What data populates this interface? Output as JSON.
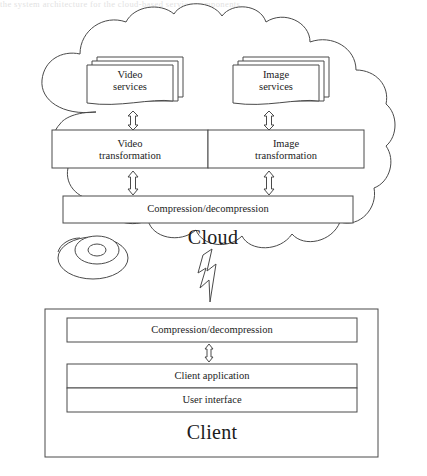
{
  "page": {
    "width": 427,
    "height": 476,
    "background": "#ffffff",
    "stroke_color": "#4a4a4a",
    "text_color": "#1c1c1c",
    "top_partial_text": "the system architecture for the cloud-based service components"
  },
  "diagram": {
    "title_cloud": "Cloud",
    "title_client": "Client",
    "cloud": {
      "label": "Cloud",
      "service_stacks": [
        {
          "name": "video-services",
          "line1": "Video",
          "line2": "services",
          "copies": 3
        },
        {
          "name": "image-services",
          "line1": "Image",
          "line2": "services",
          "copies": 3
        }
      ],
      "transformation_boxes": [
        {
          "name": "video-transformation",
          "line1": "Video",
          "line2": "transformation"
        },
        {
          "name": "image-transformation",
          "line1": "Image",
          "line2": "transformation"
        }
      ],
      "compression_box": {
        "name": "cloud-compression",
        "label": "Compression/decompression"
      },
      "storage_disc": {
        "name": "storage-disc",
        "label": ""
      }
    },
    "client": {
      "label": "Client",
      "boxes": [
        {
          "name": "client-compression",
          "label": "Compression/decompression"
        },
        {
          "name": "client-application",
          "label": "Client application"
        },
        {
          "name": "user-interface",
          "label": "User interface"
        }
      ]
    },
    "connectors": [
      {
        "name": "arrow-video-services-to-video-transformation",
        "type": "double-headed-vertical-arrow"
      },
      {
        "name": "arrow-image-services-to-image-transformation",
        "type": "double-headed-vertical-arrow"
      },
      {
        "name": "arrow-video-transformation-to-compression",
        "type": "double-headed-vertical-arrow"
      },
      {
        "name": "arrow-image-transformation-to-compression",
        "type": "double-headed-vertical-arrow"
      },
      {
        "name": "arrow-client-compression-to-client-application",
        "type": "double-headed-vertical-arrow"
      },
      {
        "name": "lightning-link-cloud-to-client",
        "type": "lightning-bolt-arrow"
      }
    ]
  }
}
